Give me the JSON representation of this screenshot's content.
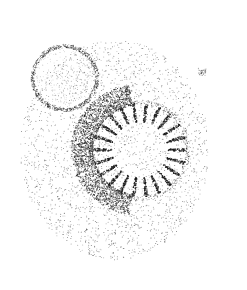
{
  "image": {
    "width": 247,
    "height": 290,
    "background": "#ffffff",
    "ink": "#1a1a1a",
    "subject": "stippled micrograph of a radially spiked ring structure beside a smaller round body"
  },
  "structures": {
    "ring": {
      "cx": 140,
      "cy": 150,
      "r_inner": 28,
      "r_outer": 47,
      "spikes": 22,
      "dark_side": "left"
    },
    "small_circle": {
      "cx": 65,
      "cy": 78,
      "r": 32
    },
    "diffuse_cloud": {
      "cx": 115,
      "cy": 150,
      "rx": 95,
      "ry": 110
    },
    "speck": {
      "cx": 202,
      "cy": 72
    }
  }
}
